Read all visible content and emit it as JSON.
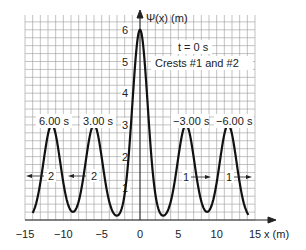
{
  "chart_data": {
    "type": "line",
    "title": "",
    "xlabel": "x (m)",
    "ylabel": "Ψ(x) (m)",
    "xlim": [
      -15,
      15
    ],
    "ylim": [
      0,
      6.3
    ],
    "grid": true,
    "x_ticks": [
      "−15",
      "−10",
      "−5",
      "0",
      "5",
      "10",
      "15"
    ],
    "y_ticks": [
      "1",
      "2",
      "3",
      "4",
      "5",
      "6"
    ],
    "annotations": {
      "time": "t = 0 s",
      "crests": "Crests #1 and #2",
      "left_outer_time": "6.00 s",
      "left_inner_time": "3.00 s",
      "right_inner_time": "−3.00 s",
      "right_outer_time": "−6.00 s",
      "left_outer_crest": "2",
      "left_inner_crest": "2",
      "right_inner_crest": "1",
      "right_outer_crest": "1"
    },
    "series": [
      {
        "name": "Ψ(x) at t = 0 s (superposed crests)",
        "peaks": [
          {
            "x": -11.5,
            "height": 3,
            "label": "6.00 s",
            "crest": 2
          },
          {
            "x": -6,
            "height": 3,
            "label": "3.00 s",
            "crest": 2
          },
          {
            "x": 0,
            "height": 6,
            "label": "t = 0 s",
            "crest": "1 and 2"
          },
          {
            "x": 6,
            "height": 3,
            "label": "−3.00 s",
            "crest": 1
          },
          {
            "x": 11.5,
            "height": 3,
            "label": "−6.00 s",
            "crest": 1
          }
        ]
      }
    ]
  }
}
